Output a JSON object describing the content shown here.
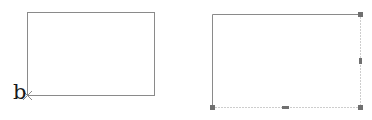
{
  "diagram": {
    "left_figure": {
      "shape": "rectangle",
      "rect": {
        "x": 27,
        "y": 12,
        "width": 127,
        "height": 83
      },
      "stroke_color": "#8a8a8a",
      "vertex_marker": {
        "symbol": "cross-icon",
        "x": 27,
        "y": 95
      },
      "vertex_label": "b"
    },
    "right_figure": {
      "shape": "rectangle-selected",
      "rect": {
        "x": 212,
        "y": 14,
        "width": 148,
        "height": 94
      },
      "stroke_color": "#8a8a8a",
      "solid_edges": [
        "top",
        "left"
      ],
      "dotted_edges": [
        "right",
        "bottom"
      ],
      "handle_color": "#707070",
      "corner_handles": [
        "top-right",
        "bottom-left",
        "bottom-right"
      ],
      "midpoint_handles": [
        "right",
        "bottom"
      ]
    }
  }
}
